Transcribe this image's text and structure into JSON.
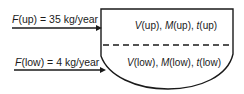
{
  "diagram": {
    "type": "two-layer basin mass balance",
    "inflows": [
      {
        "id": "up",
        "symbol": "F",
        "subscript": "(up)",
        "text": " = 35 kg/year",
        "value": 35,
        "unit": "kg/year"
      },
      {
        "id": "low",
        "symbol": "F",
        "subscript": "(low)",
        "text": " = 4 kg/year",
        "value": 4,
        "unit": "kg/year"
      }
    ],
    "layers": [
      {
        "id": "upper",
        "parts": [
          {
            "sym": "V",
            "sub": "(up)"
          },
          {
            "sep": ", "
          },
          {
            "sym": "M",
            "sub": "(up)"
          },
          {
            "sep": ", "
          },
          {
            "sym": "t",
            "sub": "(up)"
          }
        ]
      },
      {
        "id": "lower",
        "parts": [
          {
            "sym": "V",
            "sub": "(low)"
          },
          {
            "sep": ", "
          },
          {
            "sym": "M",
            "sub": "(low)"
          },
          {
            "sep": ", "
          },
          {
            "sym": "t",
            "sub": "(low)"
          }
        ]
      }
    ],
    "divider": "dashed"
  }
}
